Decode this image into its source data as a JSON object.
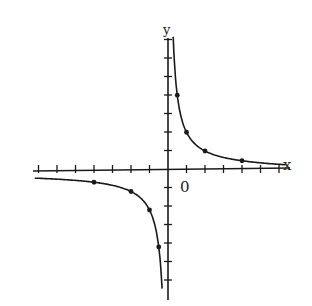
{
  "chart_data": {
    "type": "line",
    "title": "",
    "function": "y = 2/x",
    "xlabel": "x",
    "ylabel": "y",
    "origin_label": "0",
    "xlim": [
      -7,
      6
    ],
    "ylim": [
      -6,
      7
    ],
    "grid": false,
    "series": [
      {
        "name": "branch-positive",
        "points": [
          [
            0.5,
            4
          ],
          [
            1,
            2
          ],
          [
            2,
            1
          ],
          [
            4,
            0.5
          ]
        ]
      },
      {
        "name": "branch-negative",
        "points": [
          [
            -4,
            -0.5
          ],
          [
            -2,
            -1
          ],
          [
            -1,
            -2
          ],
          [
            -0.5,
            -4
          ]
        ]
      }
    ],
    "x_ticks": [
      -7,
      -6,
      -5,
      -4,
      -3,
      -2,
      -1,
      1,
      2,
      3,
      4,
      5,
      6
    ],
    "y_ticks": [
      -6,
      -5,
      -4,
      -3,
      -2,
      -1,
      1,
      2,
      3,
      4,
      5,
      6,
      7
    ]
  },
  "labels": {
    "x_axis": "x",
    "y_axis": "y",
    "origin": "0"
  }
}
